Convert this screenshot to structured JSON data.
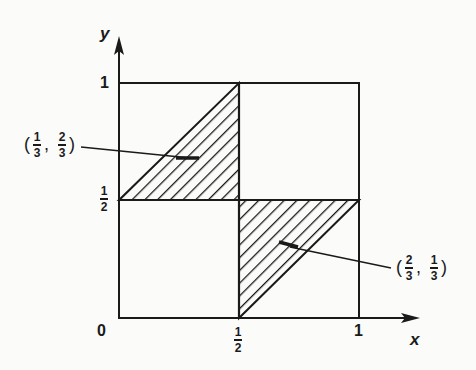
{
  "axes": {
    "x_label": "x",
    "y_label": "y",
    "origin_label": "0",
    "x_ticks": [
      {
        "num": "1",
        "den": "2"
      },
      {
        "label": "1"
      }
    ],
    "y_ticks": [
      {
        "num": "1",
        "den": "2"
      },
      {
        "label": "1"
      }
    ]
  },
  "shaded_regions": [
    {
      "name": "upper-left triangle",
      "vertices": "(0,1/2), (1/2,1/2), (1/2,1)"
    },
    {
      "name": "lower-right triangle",
      "vertices": "(1/2,0), (1/2,1/2), (1,1/2)"
    }
  ],
  "annotations": {
    "point_a": {
      "open": "(",
      "x_num": "1",
      "x_den": "3",
      "sep": ",",
      "y_num": "2",
      "y_den": "3",
      "close": ")"
    },
    "point_b": {
      "open": "(",
      "x_num": "2",
      "x_den": "3",
      "sep": ",",
      "y_num": "1",
      "y_den": "3",
      "close": ")"
    }
  },
  "colors": {
    "ink": "#1a1a1a",
    "paper": "#fbfbfa"
  }
}
